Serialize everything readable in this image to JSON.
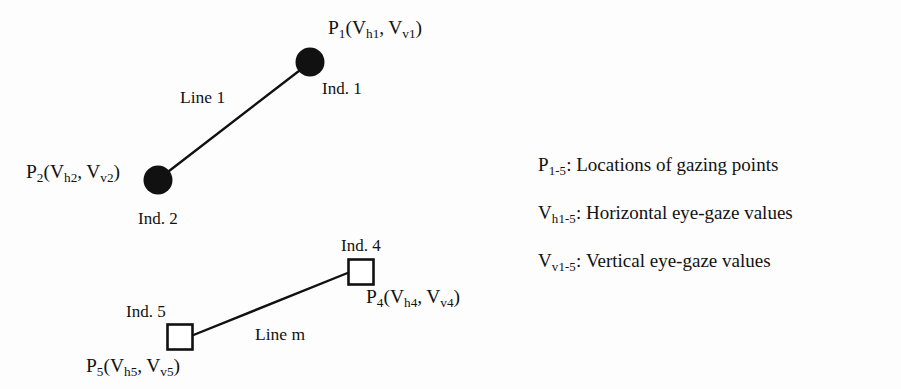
{
  "figure": {
    "background_color": "#fdfdfd",
    "stroke_color": "#111111",
    "marker_fill_circle": "#111111",
    "marker_fill_square": "#ffffff"
  },
  "line1": {
    "name": "Line 1",
    "label": "Line 1",
    "point_a": {
      "id": "P1",
      "label_prefix": "P",
      "label_sub": "1",
      "coord_h": "V",
      "coord_h_sub": "h1",
      "coord_v": "V",
      "coord_v_sub": "v1",
      "full_label": "P1(Vh1, Vv1)",
      "marker": "filled-circle",
      "individual_label": "Ind. 1"
    },
    "point_b": {
      "id": "P2",
      "label_prefix": "P",
      "label_sub": "2",
      "coord_h": "V",
      "coord_h_sub": "h2",
      "coord_v": "V",
      "coord_v_sub": "v2",
      "full_label": "P2(Vh2, Vv2)",
      "marker": "filled-circle",
      "individual_label": "Ind. 2"
    }
  },
  "linem": {
    "name": "Line m",
    "label": "Line m",
    "point_a": {
      "id": "P4",
      "label_prefix": "P",
      "label_sub": "4",
      "coord_h": "V",
      "coord_h_sub": "h4",
      "coord_v": "V",
      "coord_v_sub": "v4",
      "full_label": "P4(Vh4, Vv4)",
      "marker": "open-square",
      "individual_label": "Ind. 4"
    },
    "point_b": {
      "id": "P5",
      "label_prefix": "P",
      "label_sub": "5",
      "coord_h": "V",
      "coord_h_sub": "h5",
      "coord_v": "V",
      "coord_v_sub": "v5",
      "full_label": "P5(Vh5, Vv5)",
      "marker": "open-square",
      "individual_label": "Ind. 5"
    }
  },
  "legend": {
    "items": [
      {
        "symbol_base": "P",
        "symbol_sub": "1-5",
        "separator": ": ",
        "description": "Locations of gazing points"
      },
      {
        "symbol_base": "V",
        "symbol_sub": "h1-5",
        "separator": ": ",
        "description": "Horizontal eye-gaze values"
      },
      {
        "symbol_base": "V",
        "symbol_sub": "v1-5",
        "separator": ": ",
        "description": "Vertical eye-gaze values"
      }
    ]
  }
}
